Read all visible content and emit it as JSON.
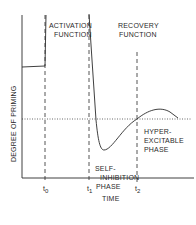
{
  "diagram": {
    "y_axis_label": "DEGREE OF PRIMING",
    "x_axis_label": "TIME",
    "regions": {
      "activation": [
        "ACTIVATION",
        "FUNCTION"
      ],
      "recovery": [
        "RECOVERY",
        "FUNCTION"
      ]
    },
    "phases": {
      "self_inhibition": [
        "SELF-",
        "INHIBITION",
        "PHASE"
      ],
      "hyper_excitable": [
        "HYPER-",
        "EXCITABLE",
        "PHASE"
      ]
    },
    "time_markers": [
      {
        "t": "t",
        "sub": "0"
      },
      {
        "t": "t",
        "sub": "1"
      },
      {
        "t": "t",
        "sub": "2"
      }
    ],
    "colors": {
      "ink": "#2a2a2a",
      "background": "#ffffff"
    }
  }
}
